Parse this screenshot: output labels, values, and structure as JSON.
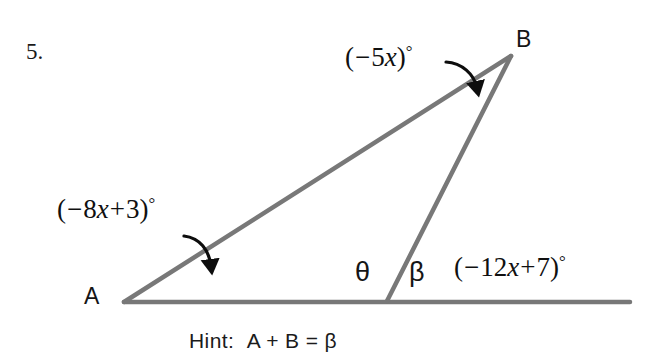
{
  "page": {
    "problem_number": "5.",
    "background_color": "#ffffff",
    "width": 664,
    "height": 359
  },
  "figure": {
    "type": "geometry-diagram",
    "line_color": "#777777",
    "line_width": 4,
    "arrow_color": "#0d0d0d",
    "points": {
      "A": {
        "x": 124,
        "y": 302
      },
      "B": {
        "x": 511,
        "y": 56
      },
      "C": {
        "x": 387,
        "y": 301
      },
      "base_right_end": {
        "x": 630,
        "y": 302
      }
    },
    "segments": [
      {
        "name": "base-line-A-to-right",
        "from": "A",
        "to": "base_right_end"
      },
      {
        "name": "side-A-to-B",
        "from": "A",
        "to": "B"
      },
      {
        "name": "side-B-to-C",
        "from": "B",
        "to": "C"
      }
    ],
    "arrows": [
      {
        "name": "arrow-to-angle-b",
        "from": {
          "x": 447,
          "y": 62
        },
        "to": {
          "x": 478,
          "y": 96
        }
      },
      {
        "name": "arrow-to-angle-a",
        "from": {
          "x": 184,
          "y": 236
        },
        "to": {
          "x": 212,
          "y": 276
        }
      }
    ]
  },
  "labels": {
    "vertex_a": "A",
    "vertex_b": "B",
    "theta": "θ",
    "beta": "β",
    "angle_b": {
      "open_paren": "(",
      "minus": "−",
      "coefficient": "5",
      "variable": "x",
      "close_paren": ")",
      "degree": "°",
      "text": "(−5x)°"
    },
    "angle_a": {
      "open_paren": "(",
      "minus": "−",
      "coefficient": "8",
      "variable": "x",
      "plus": "+",
      "constant": "3",
      "close_paren": ")",
      "degree": "°",
      "text": "(−8x+3)°"
    },
    "angle_exterior": {
      "open_paren": "(",
      "minus": "−",
      "coefficient": "12",
      "variable": "x",
      "plus": "+",
      "constant": "7",
      "close_paren": ")",
      "degree": "°",
      "text": "(−12x+7)°"
    }
  },
  "hint": {
    "prefix": "Hint:",
    "equation": "A + B = β",
    "text": "Hint:  A + B = β"
  }
}
